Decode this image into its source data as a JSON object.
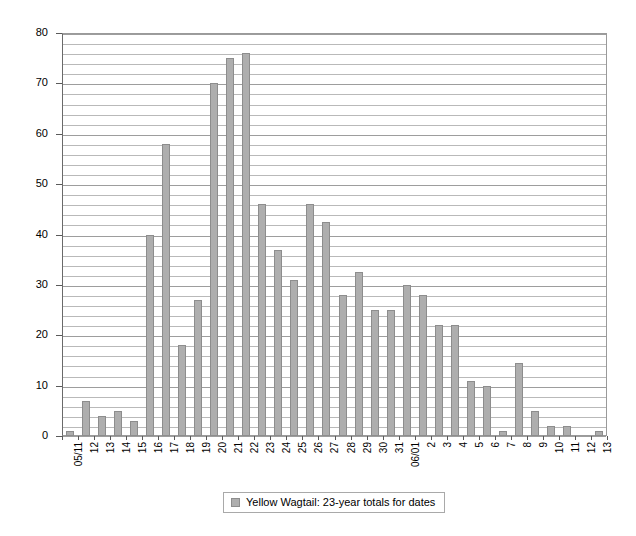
{
  "chart_data": {
    "type": "bar",
    "title": "",
    "subtitle": "",
    "xlabel": "",
    "ylabel": "",
    "ylim": [
      0,
      80
    ],
    "y_major_step": 10,
    "y_minor_step": 2,
    "grid": true,
    "grid_axis": "y",
    "legend_position": "bottom",
    "y_ticks": [
      0,
      10,
      20,
      30,
      40,
      50,
      60,
      70,
      80
    ],
    "series": [
      {
        "name": "Yellow Wagtail: 23-year totals for dates",
        "color": "#aeaeae",
        "border_color": "#8d8d8d",
        "values": [
          1,
          7,
          4,
          5,
          3,
          40,
          58,
          18,
          27,
          70,
          75,
          76,
          46,
          37,
          31,
          46,
          42.5,
          28,
          32.5,
          25,
          25,
          30,
          28,
          22,
          22,
          11,
          10,
          1,
          14.5,
          5,
          2,
          2,
          0,
          1
        ]
      }
    ],
    "categories": [
      "05/11",
      "12",
      "13",
      "14",
      "15",
      "16",
      "17",
      "18",
      "19",
      "20",
      "21",
      "22",
      "23",
      "24",
      "25",
      "26",
      "27",
      "28",
      "29",
      "30",
      "31",
      "06/01",
      "2",
      "3",
      "4",
      "5",
      "6",
      "7",
      "8",
      "9",
      "10",
      "11",
      "12",
      "13"
    ]
  },
  "legend": {
    "entries": [
      {
        "label": "Yellow Wagtail: 23-year totals for dates",
        "swatch_color": "#aeaeae"
      }
    ]
  }
}
